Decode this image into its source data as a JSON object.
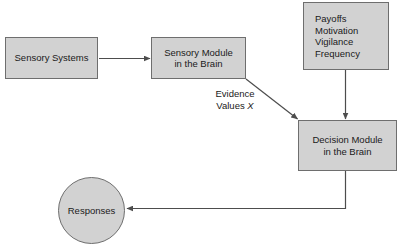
{
  "diagram": {
    "background_color": "#ffffff",
    "node_fill_color": "#d2d2d2",
    "node_border_color": "#6e6e6e",
    "edge_color": "#4d4d4d",
    "text_color": "#1a1a1a",
    "nodes": [
      {
        "id": "sensory-systems",
        "label": "Sensory Systems",
        "shape": "rectangle",
        "x": 5,
        "y": 37,
        "width": 93,
        "height": 42
      },
      {
        "id": "sensory-module",
        "label": "Sensory Module\nin the Brain",
        "shape": "rectangle",
        "x": 151,
        "y": 37,
        "width": 95,
        "height": 42
      },
      {
        "id": "payoffs",
        "label": "Payoffs\nMotivation\nVigilance\nFrequency",
        "shape": "rectangle",
        "x": 303,
        "y": 2,
        "width": 86,
        "height": 68
      },
      {
        "id": "decision-module",
        "label": "Decision Module\nin the Brain",
        "shape": "rectangle",
        "x": 298,
        "y": 120,
        "width": 99,
        "height": 51
      },
      {
        "id": "responses",
        "label": "Responses",
        "shape": "ellipse",
        "x": 58,
        "y": 177,
        "width": 67,
        "height": 67
      }
    ],
    "edges": [
      {
        "id": "sensory-systems-to-sensory-module",
        "from": "sensory-systems",
        "to": "sensory-module",
        "label": "",
        "arrow": "end"
      },
      {
        "id": "sensory-module-to-decision-module",
        "from": "sensory-module",
        "to": "decision-module",
        "label": "Evidence\nValues X",
        "arrow": "end"
      },
      {
        "id": "payoffs-to-decision-module",
        "from": "payoffs",
        "to": "decision-module",
        "label": "",
        "arrow": "end"
      },
      {
        "id": "decision-module-to-responses",
        "from": "decision-module",
        "to": "responses",
        "label": "",
        "arrow": "end"
      }
    ],
    "edge_labels": {
      "evidence_line1": "Evidence",
      "evidence_line2": "Values ",
      "evidence_variable": "X"
    }
  }
}
